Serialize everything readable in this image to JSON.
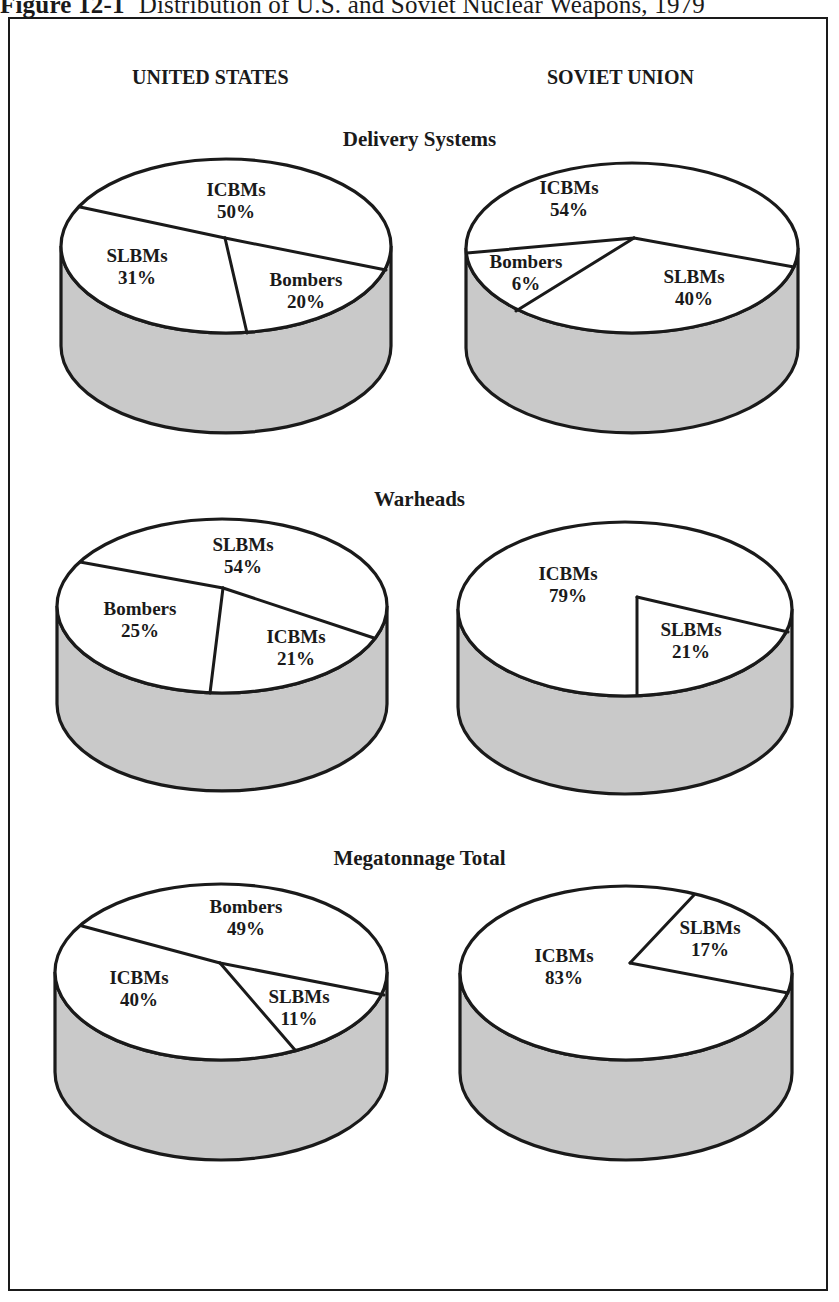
{
  "figure": {
    "number": "Figure 12-1",
    "title": "Distribution of U.S. and Soviet Nuclear Weapons, 1979"
  },
  "columns": {
    "left": "UNITED STATES",
    "right": "SOVIET UNION"
  },
  "sections": {
    "delivery": "Delivery Systems",
    "warheads": "Warheads",
    "megatonnage": "Megatonnage Total"
  },
  "colors": {
    "top_face": "#ffffff",
    "side_face": "#c9c9c9",
    "stroke": "#1a1a1a"
  },
  "chart_data": [
    {
      "type": "pie",
      "title": "Delivery Systems — United States",
      "categories": [
        "ICBMs",
        "SLBMs",
        "Bombers"
      ],
      "values": [
        50,
        31,
        20
      ],
      "unit": "%"
    },
    {
      "type": "pie",
      "title": "Delivery Systems — Soviet Union",
      "categories": [
        "ICBMs",
        "SLBMs",
        "Bombers"
      ],
      "values": [
        54,
        40,
        6
      ],
      "unit": "%"
    },
    {
      "type": "pie",
      "title": "Warheads — United States",
      "categories": [
        "SLBMs",
        "Bombers",
        "ICBMs"
      ],
      "values": [
        54,
        25,
        21
      ],
      "unit": "%"
    },
    {
      "type": "pie",
      "title": "Warheads — Soviet Union",
      "categories": [
        "ICBMs",
        "SLBMs"
      ],
      "values": [
        79,
        21
      ],
      "unit": "%"
    },
    {
      "type": "pie",
      "title": "Megatonnage Total — United States",
      "categories": [
        "Bombers",
        "ICBMs",
        "SLBMs"
      ],
      "values": [
        49,
        40,
        11
      ],
      "unit": "%"
    },
    {
      "type": "pie",
      "title": "Megatonnage Total — Soviet Union",
      "categories": [
        "ICBMs",
        "SLBMs"
      ],
      "values": [
        83,
        17
      ],
      "unit": "%"
    }
  ],
  "pies": [
    {
      "name": "us-delivery-pie",
      "cx": 226,
      "cy": 246,
      "rx": 165,
      "ry": 87,
      "depth": 100,
      "hub": [
        225,
        238
      ],
      "spokes": [
        [
          80,
          207
        ],
        [
          386,
          270
        ],
        [
          247,
          333
        ]
      ],
      "labels": [
        {
          "name": "ICBMs",
          "value": "50%",
          "x": 236,
          "y": 196
        },
        {
          "name": "SLBMs",
          "value": "31%",
          "x": 137,
          "y": 262
        },
        {
          "name": "Bombers",
          "value": "20%",
          "x": 306,
          "y": 286
        }
      ]
    },
    {
      "name": "ussr-delivery-pie",
      "cx": 632,
      "cy": 248,
      "rx": 166,
      "ry": 85,
      "depth": 100,
      "hub": [
        634,
        238
      ],
      "spokes": [
        [
          467,
          253
        ],
        [
          794,
          267
        ],
        [
          516,
          311
        ]
      ],
      "labels": [
        {
          "name": "ICBMs",
          "value": "54%",
          "x": 569,
          "y": 194
        },
        {
          "name": "Bombers",
          "value": "6%",
          "x": 526,
          "y": 268
        },
        {
          "name": "SLBMs",
          "value": "40%",
          "x": 694,
          "y": 283
        }
      ]
    },
    {
      "name": "us-warheads-pie",
      "cx": 222,
      "cy": 606,
      "rx": 165,
      "ry": 87,
      "depth": 98,
      "hub": [
        223,
        588
      ],
      "spokes": [
        [
          80,
          562
        ],
        [
          374,
          638
        ],
        [
          210,
          693
        ]
      ],
      "labels": [
        {
          "name": "SLBMs",
          "value": "54%",
          "x": 243,
          "y": 551
        },
        {
          "name": "Bombers",
          "value": "25%",
          "x": 140,
          "y": 615
        },
        {
          "name": "ICBMs",
          "value": "21%",
          "x": 296,
          "y": 643
        }
      ]
    },
    {
      "name": "ussr-warheads-pie",
      "cx": 625,
      "cy": 609,
      "rx": 167,
      "ry": 87,
      "depth": 98,
      "hub": [
        637,
        597
      ],
      "spokes": [
        [
          788,
          632
        ],
        [
          637,
          695
        ]
      ],
      "labels": [
        {
          "name": "ICBMs",
          "value": "79%",
          "x": 568,
          "y": 580
        },
        {
          "name": "SLBMs",
          "value": "21%",
          "x": 691,
          "y": 636
        }
      ]
    },
    {
      "name": "us-megatonnage-pie",
      "cx": 221,
      "cy": 972,
      "rx": 166,
      "ry": 88,
      "depth": 100,
      "hub": [
        220,
        963
      ],
      "spokes": [
        [
          82,
          926
        ],
        [
          384,
          995
        ],
        [
          295,
          1050
        ]
      ],
      "labels": [
        {
          "name": "Bombers",
          "value": "49%",
          "x": 246,
          "y": 913
        },
        {
          "name": "ICBMs",
          "value": "40%",
          "x": 139,
          "y": 984
        },
        {
          "name": "SLBMs",
          "value": "11%",
          "x": 299,
          "y": 1003
        }
      ]
    },
    {
      "name": "ussr-megatonnage-pie",
      "cx": 626,
      "cy": 973,
      "rx": 166,
      "ry": 87,
      "depth": 100,
      "hub": [
        630,
        963
      ],
      "spokes": [
        [
          694,
          895
        ],
        [
          788,
          993
        ]
      ],
      "labels": [
        {
          "name": "ICBMs",
          "value": "83%",
          "x": 564,
          "y": 962
        },
        {
          "name": "SLBMs",
          "value": "17%",
          "x": 710,
          "y": 934
        }
      ]
    }
  ]
}
